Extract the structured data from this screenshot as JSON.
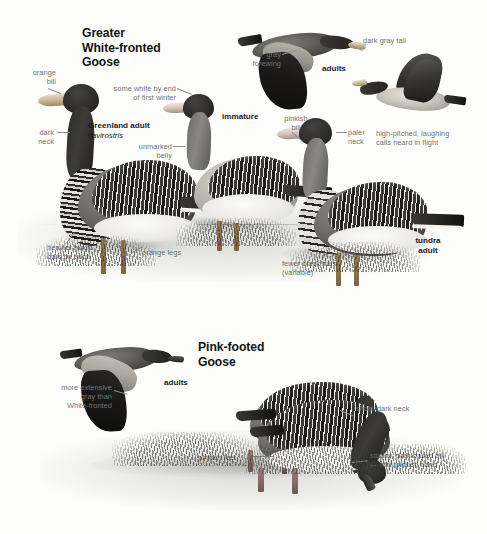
{
  "plate": {
    "width": 487,
    "height": 534,
    "background_color": "#fdfdfb",
    "label_color": "#6f7375",
    "title_color": "#111314"
  },
  "species": [
    {
      "id": "greater-white-fronted-goose",
      "title": "Greater\nWhite-fronted\nGoose",
      "title_lines": [
        "Greater",
        "White-fronted",
        "Goose"
      ]
    },
    {
      "id": "pink-footed-goose",
      "title": "Pink-footed\nGoose",
      "title_lines": [
        "Pink-footed",
        "Goose"
      ]
    }
  ],
  "labels": {
    "orange_bill": "orange\nbill",
    "dark_neck": "dark\nneck",
    "some_white": "some white by end\nof first winter",
    "unmarked_belly": "unmarked\nbelly",
    "heavier_black_bars": "heavier black\nbars on adult",
    "orange_legs": "orange legs",
    "gray_forewing": "gray\nforewing",
    "dark_gray_tail": "dark gray tail",
    "pinkish_bill": "pinkish\nbill",
    "paler_neck": "paler\nneck",
    "high_pitched": "high-pitched, laughing\ncalls heard in flight",
    "fewer_black_bars": "fewer black bars\n(variable)",
    "more_extensive_gray": "more extensive\ngray than\nWhite-fronted",
    "pinkish_feet": "pinkish feet",
    "short_dark_neck": "short, dark neck",
    "stubby_bill": "stubby, dark-based bill\n— with pinkish band"
  },
  "age_labels": {
    "greenland_adult": "Greenland adult",
    "greenland_sciname": "flavirostris",
    "immature": "immature",
    "adults_top": "adults",
    "tundra_adult": "tundra\nadult",
    "adults_bottom": "adults"
  }
}
